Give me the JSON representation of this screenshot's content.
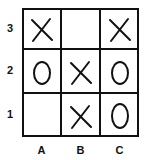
{
  "board": {
    "rows": [
      "3",
      "2",
      "1"
    ],
    "columns": [
      "A",
      "B",
      "C"
    ],
    "cells": [
      [
        "X",
        "",
        "X"
      ],
      [
        "O",
        "X",
        "O"
      ],
      [
        "",
        "X",
        "O"
      ]
    ]
  },
  "labels": {
    "row_3": "3",
    "row_2": "2",
    "row_1": "1",
    "col_a": "A",
    "col_b": "B",
    "col_c": "C"
  }
}
